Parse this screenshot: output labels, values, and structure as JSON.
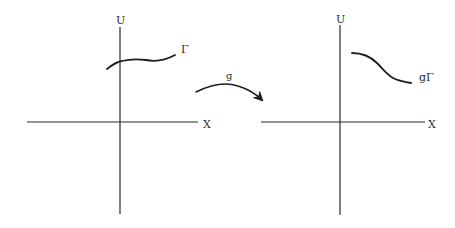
{
  "diagram": {
    "left_panel": {
      "vertical_axis_label": "U",
      "horizontal_axis_label": "X",
      "curve_label": "Γ"
    },
    "mapping": {
      "label": "g"
    },
    "right_panel": {
      "vertical_axis_label": "U",
      "horizontal_axis_label": "X",
      "curve_label": "gΓ"
    },
    "colors": {
      "ink": "#1e1e1e",
      "background": "#ffffff"
    }
  }
}
